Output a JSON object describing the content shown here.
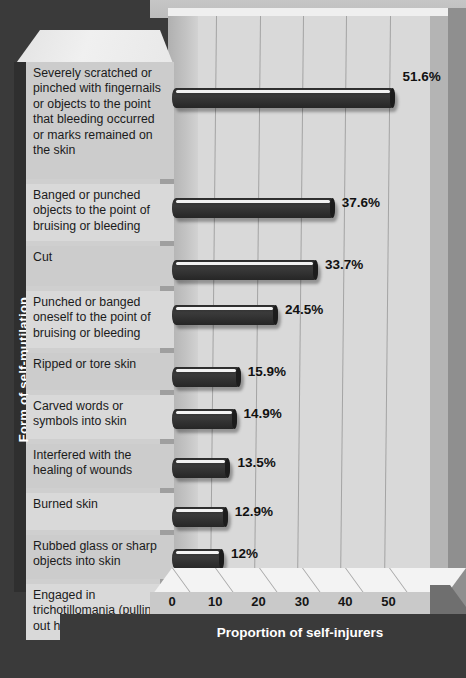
{
  "chart_data": {
    "type": "bar",
    "orientation": "horizontal",
    "title": "",
    "xlabel": "Proportion of self-injurers",
    "ylabel": "Form of self-mutilation",
    "xlim": [
      0,
      57
    ],
    "xticks": [
      0,
      10,
      20,
      30,
      40,
      50
    ],
    "xtick_labels": [
      "0",
      "10",
      "20",
      "30",
      "40",
      "50"
    ],
    "grid": true,
    "grid_axis": "x",
    "legend": "none",
    "categories": [
      "Severely scratched or pinched with fingernails or objects to the point that bleeding occurred or marks remained on the skin",
      "Banged or punched objects to the point of bruising or bleeding",
      "Cut",
      "Punched or banged oneself to the point of bruising or bleeding",
      "Ripped or tore skin",
      "Carved words or symbols into skin",
      "Interfered with the healing of wounds",
      "Burned skin",
      "Rubbed glass or sharp objects into skin",
      "Engaged in trichotillomania (pulling out hair)"
    ],
    "values": [
      51.6,
      37.6,
      33.7,
      24.5,
      15.9,
      14.9,
      13.5,
      12.9,
      12.0,
      11.0
    ],
    "value_labels": [
      "51.6%",
      "37.6%",
      "33.7%",
      "24.5%",
      "15.9%",
      "14.9%",
      "13.5%",
      "12.9%",
      "12%",
      "11%"
    ],
    "bar_color": "#2f2f2f",
    "plot_background": "#d9d9d9",
    "frame_color": "#3a3a3a"
  },
  "axis": {
    "x_title": "Proportion of self-injurers",
    "y_title": "Form of self-mutilation"
  }
}
